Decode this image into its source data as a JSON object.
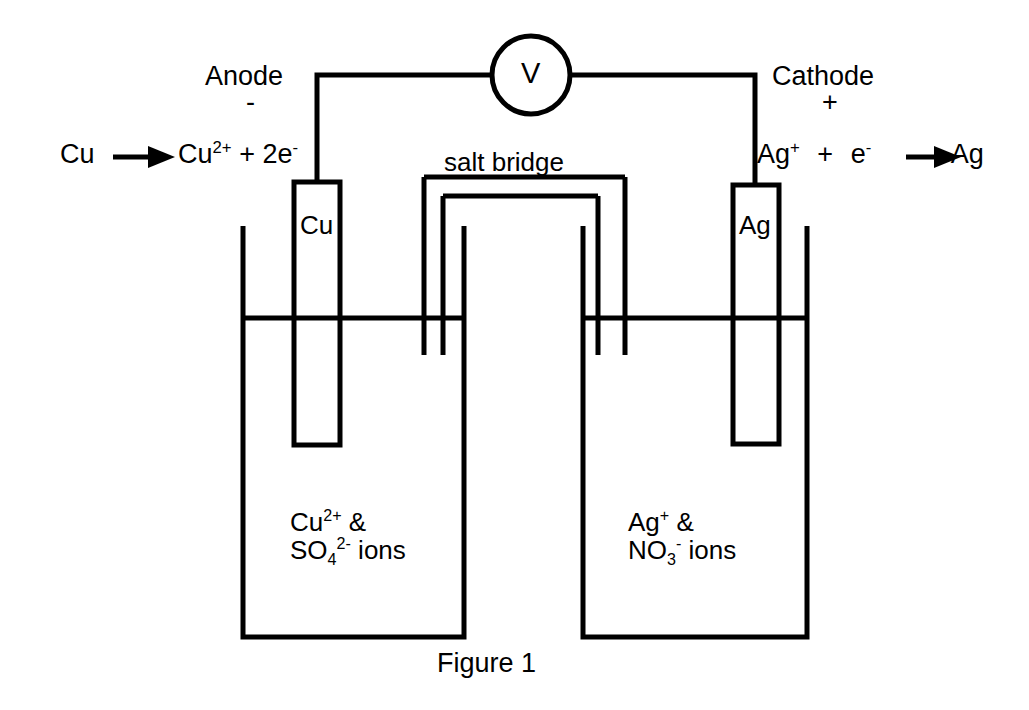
{
  "figure": {
    "caption": "Figure 1"
  },
  "electrodes": {
    "left": {
      "label": "Cu",
      "role_label": "Anode",
      "charge_sign": "-",
      "half_reaction_plain": "Cu → Cu2+ + 2e-",
      "half_reaction_parts": {
        "reactant": "Cu",
        "arrow": "➤",
        "product_symbol": "Cu",
        "product_charge": "2+",
        "plus": "+",
        "electrons_count": "2",
        "electron_symbol": "e",
        "electron_charge": "-"
      }
    },
    "right": {
      "label": "Ag",
      "role_label": "Cathode",
      "charge_sign": "+",
      "half_reaction_plain": "Ag+ + e- → Ag",
      "half_reaction_parts": {
        "reactant_symbol": "Ag",
        "reactant_charge": "+",
        "plus": "+",
        "electron_symbol": "e",
        "electron_charge": "-",
        "arrow": "➤",
        "product": "Ag"
      }
    }
  },
  "meter": {
    "label": "V",
    "name": "voltmeter"
  },
  "salt_bridge": {
    "label": "salt bridge"
  },
  "solutions": {
    "left": {
      "line1_symbol": "Cu",
      "line1_charge": "2+",
      "line1_suffix": "&",
      "line2_symbol": "SO",
      "line2_subscript": "4",
      "line2_charge": "2-",
      "line2_suffix": "ions",
      "plain": "Cu2+ & SO42- ions"
    },
    "right": {
      "line1_symbol": "Ag",
      "line1_charge": "+",
      "line1_suffix": "&",
      "line2_symbol": "NO",
      "line2_subscript": "3",
      "line2_charge": "-",
      "line2_suffix": "ions",
      "plain": "Ag+ & NO3- ions"
    }
  },
  "colors": {
    "ink": "#000000",
    "background": "#ffffff"
  }
}
